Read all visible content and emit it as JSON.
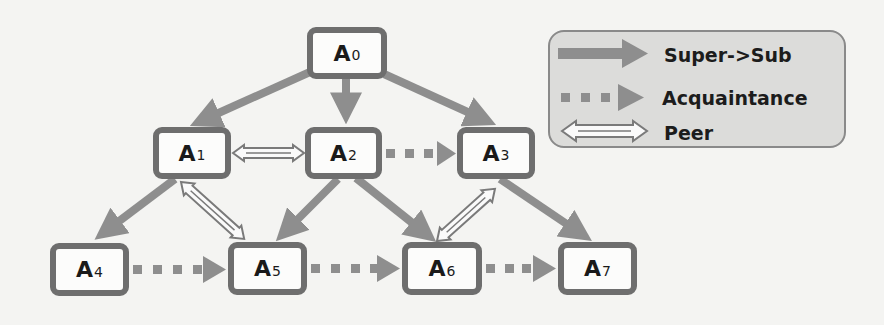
{
  "diagram": {
    "nodes": [
      {
        "id": "A0",
        "base": "A",
        "sub": "0",
        "x": 307,
        "y": 27,
        "w": 80,
        "h": 52
      },
      {
        "id": "A1",
        "base": "A",
        "sub": "1",
        "x": 153,
        "y": 127,
        "w": 78,
        "h": 52
      },
      {
        "id": "A2",
        "base": "A",
        "sub": "2",
        "x": 305,
        "y": 127,
        "w": 77,
        "h": 52
      },
      {
        "id": "A3",
        "base": "A",
        "sub": "3",
        "x": 457,
        "y": 127,
        "w": 78,
        "h": 52
      },
      {
        "id": "A4",
        "base": "A",
        "sub": "4",
        "x": 50,
        "y": 243,
        "w": 79,
        "h": 53
      },
      {
        "id": "A5",
        "base": "A",
        "sub": "5",
        "x": 228,
        "y": 242,
        "w": 79,
        "h": 53
      },
      {
        "id": "A6",
        "base": "A",
        "sub": "6",
        "x": 402,
        "y": 242,
        "w": 80,
        "h": 53
      },
      {
        "id": "A7",
        "base": "A",
        "sub": "7",
        "x": 558,
        "y": 242,
        "w": 79,
        "h": 53
      }
    ],
    "edges": [
      {
        "from": "A0",
        "to": "A1",
        "type": "super-sub"
      },
      {
        "from": "A0",
        "to": "A2",
        "type": "super-sub"
      },
      {
        "from": "A0",
        "to": "A3",
        "type": "super-sub"
      },
      {
        "from": "A1",
        "to": "A4",
        "type": "super-sub"
      },
      {
        "from": "A2",
        "to": "A5",
        "type": "super-sub"
      },
      {
        "from": "A2",
        "to": "A6",
        "type": "super-sub"
      },
      {
        "from": "A3",
        "to": "A7",
        "type": "super-sub"
      },
      {
        "from": "A2",
        "to": "A3",
        "type": "acquaintance"
      },
      {
        "from": "A4",
        "to": "A5",
        "type": "acquaintance"
      },
      {
        "from": "A5",
        "to": "A6",
        "type": "acquaintance"
      },
      {
        "from": "A6",
        "to": "A7",
        "type": "acquaintance"
      },
      {
        "from": "A1",
        "to": "A2",
        "type": "peer"
      },
      {
        "from": "A1",
        "to": "A5",
        "type": "peer"
      },
      {
        "from": "A6",
        "to": "A3",
        "type": "peer"
      }
    ],
    "legend": {
      "items": [
        {
          "type": "super-sub",
          "label": "Super->Sub"
        },
        {
          "type": "acquaintance",
          "label": "Acquaintance"
        },
        {
          "type": "peer",
          "label": "Peer"
        }
      ]
    },
    "colors": {
      "arrow": "#8e8e8e",
      "node_border": "#6e6e6e",
      "legend_bg": "#dcdcda",
      "background": "#f4f4f2"
    }
  }
}
